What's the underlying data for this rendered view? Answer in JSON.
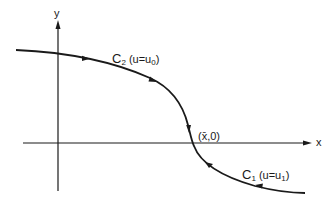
{
  "diagram": {
    "axes": {
      "x_label": "x",
      "y_label": "y"
    },
    "curves": [
      {
        "name": "C2",
        "label_main": "C",
        "label_sub": "2",
        "condition_prefix": "(u=u",
        "condition_sub": "0",
        "condition_suffix": ")"
      },
      {
        "name": "C1",
        "label_main": "C",
        "label_sub": "1",
        "condition_prefix": "(u=u",
        "condition_sub": "1",
        "condition_suffix": ")"
      }
    ],
    "point": {
      "label": "(x̄,0)"
    },
    "colors": {
      "line": "#1a1a1a",
      "background": "#ffffff"
    }
  }
}
